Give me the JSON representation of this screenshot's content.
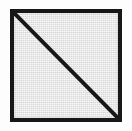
{
  "figure": {
    "canvas": {
      "width": 132,
      "height": 131,
      "background_color": "#fdfdfd"
    },
    "square": {
      "name": "square",
      "x": 10,
      "y": 9,
      "width": 112,
      "height": 113,
      "border_width": 4,
      "border_color": "#171717",
      "fill_color": "#d9d9d9",
      "fill_texture": "fine-halftone-grid"
    },
    "diagonal": {
      "name": "diagonal-line",
      "from_corner": "top-left",
      "to_corner": "bottom-right",
      "stroke_width": 4,
      "stroke_color": "#171717",
      "x1": 0,
      "y1": 0,
      "x2": 104,
      "y2": 105
    },
    "regions": [
      {
        "name": "upper-right-triangle",
        "fill_color": "#d9d9d9"
      },
      {
        "name": "lower-left-triangle",
        "fill_color": "#d9d9d9"
      }
    ]
  }
}
